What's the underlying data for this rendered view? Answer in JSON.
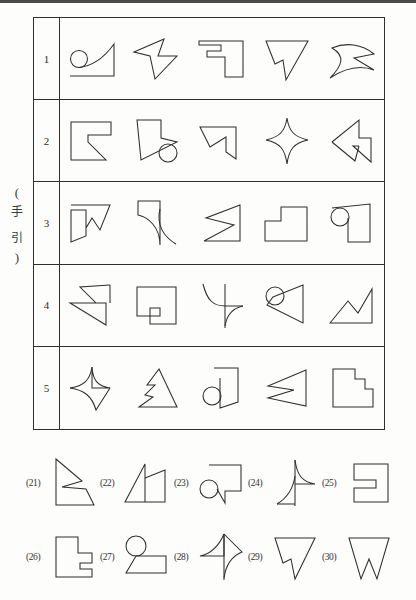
{
  "page": {
    "kind": "scanned-worksheet",
    "guide_label": {
      "open_paren": "(",
      "char1": "手",
      "char2": "引",
      "close_paren": ")"
    },
    "ink_color": "#2e2e2e",
    "rule_color": "#2f2f2f",
    "paper_color": "#fdfdfc"
  },
  "guide_table": {
    "row_numbers": [
      "1",
      "2",
      "3",
      "4",
      "5"
    ],
    "columns": 5,
    "rows": [
      {
        "number": "1",
        "figures": [
          "circle-with-curved-wedge",
          "arrow-triangle-right",
          "bracket-step-block",
          "notched-inverted-triangle",
          "bowtie-dart"
        ]
      },
      {
        "number": "2",
        "figures": [
          "square-with-inner-notch",
          "flag-with-circle",
          "square-with-zigzag-corner",
          "four-point-concave-star",
          "triangle-with-inner-arrow"
        ]
      },
      {
        "number": "3",
        "figures": [
          "stepped-arrowhead",
          "curved-hook-wedge",
          "zigzag-triangle-strip",
          "stepped-l-block",
          "circle-on-block"
        ]
      },
      {
        "number": "4",
        "figures": [
          "double-notched-arrow",
          "u-notch-block",
          "curved-cross-wedge",
          "circle-with-slanted-block",
          "zigzag-valley-triangle"
        ]
      },
      {
        "number": "5",
        "figures": [
          "four-point-curved-star",
          "triangle-with-notch",
          "circle-with-flag-block",
          "zigzag-arrow-triangle",
          "stair-step-block"
        ]
      }
    ]
  },
  "questions": {
    "rows": [
      {
        "items": [
          {
            "number": "(21)",
            "figure": "notched-arrow-polygon"
          },
          {
            "number": "(22)",
            "figure": "double-triangle-peak"
          },
          {
            "number": "(23)",
            "figure": "circle-with-notched-block"
          },
          {
            "number": "(24)",
            "figure": "curved-spike-wedge"
          },
          {
            "number": "(25)",
            "figure": "block-with-side-notch"
          }
        ]
      },
      {
        "items": [
          {
            "number": "(26)",
            "figure": "stepped-l-notch-block"
          },
          {
            "number": "(27)",
            "figure": "circle-over-trapezoid"
          },
          {
            "number": "(28)",
            "figure": "curved-arrow-spike"
          },
          {
            "number": "(29)",
            "figure": "notched-inverted-triangle"
          },
          {
            "number": "(30)",
            "figure": "inverted-triangle-v-notch"
          }
        ]
      }
    ]
  }
}
